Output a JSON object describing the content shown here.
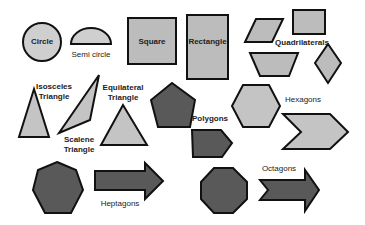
{
  "colors": {
    "light_fill": "#c8c8c8",
    "dark_fill": "#595959",
    "stroke": "#111111",
    "background": "#ffffff"
  },
  "shapes": {
    "circle": {
      "label": "Circle"
    },
    "semicircle": {
      "label": "Semi circle"
    },
    "square": {
      "label": "Square"
    },
    "rectangle": {
      "label": "Rectangle"
    },
    "quadrilaterals": {
      "label": "Quadrilaterals"
    },
    "isosceles": {
      "label1": "Isosceles",
      "label2": "Triangle"
    },
    "scalene": {
      "label1": "Scalene",
      "label2": "Triangle"
    },
    "equilateral": {
      "label1": "Equilateral",
      "label2": "Triangle"
    },
    "polygons": {
      "label": "Polygons"
    },
    "hexagons": {
      "label": "Hexagons"
    },
    "heptagons": {
      "label": "Heptagons"
    },
    "octagons": {
      "label": "Octagons"
    }
  }
}
